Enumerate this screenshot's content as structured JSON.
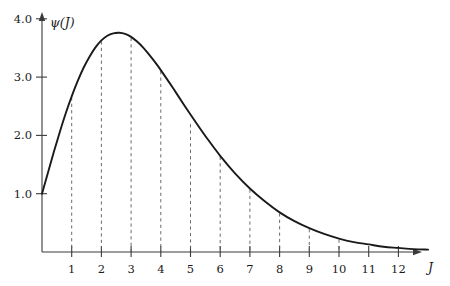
{
  "chart_data": {
    "type": "line",
    "title": "",
    "xlabel": "J",
    "ylabel": "ψ(J)",
    "xlim": [
      0,
      13.2
    ],
    "ylim": [
      0,
      4.35
    ],
    "grid": false,
    "legend": "none",
    "x_ticks": [
      1,
      2,
      3,
      4,
      5,
      6,
      7,
      8,
      9,
      10,
      11,
      12
    ],
    "x_tick_labels": [
      "1",
      "2",
      "3",
      "4",
      "5",
      "6",
      "7",
      "8",
      "9",
      "10",
      "11",
      "12"
    ],
    "y_ticks": [
      1.0,
      2.0,
      3.0,
      4.0
    ],
    "y_tick_labels": [
      "1.0",
      "2.0",
      "3.0",
      "4.0"
    ],
    "series": [
      {
        "name": "ψ(J)",
        "color": "#1a1a1a",
        "x": [
          0.0,
          0.2,
          0.4,
          0.6,
          0.8,
          1.0,
          1.2,
          1.4,
          1.6,
          1.8,
          2.0,
          2.2,
          2.4,
          2.6,
          2.8,
          3.0,
          3.2,
          3.4,
          3.6,
          3.8,
          4.0,
          4.4,
          4.8,
          5.2,
          5.6,
          6.0,
          6.5,
          7.0,
          7.5,
          8.0,
          8.5,
          9.0,
          9.5,
          10.0,
          10.5,
          11.0,
          11.5,
          12.0,
          12.5,
          13.0
        ],
        "y": [
          1.0,
          1.36,
          1.72,
          2.06,
          2.38,
          2.67,
          2.93,
          3.16,
          3.35,
          3.51,
          3.63,
          3.71,
          3.75,
          3.76,
          3.74,
          3.69,
          3.61,
          3.51,
          3.39,
          3.26,
          3.12,
          2.82,
          2.51,
          2.21,
          1.92,
          1.65,
          1.35,
          1.09,
          0.87,
          0.68,
          0.53,
          0.41,
          0.31,
          0.23,
          0.17,
          0.13,
          0.09,
          0.07,
          0.05,
          0.04
        ]
      }
    ],
    "dashed_dropline_x": [
      1,
      2,
      3,
      4,
      5,
      6,
      7,
      8,
      9,
      10
    ],
    "dashed_dropline_y": [
      2.67,
      3.63,
      3.69,
      3.12,
      2.21,
      1.65,
      1.09,
      0.68,
      0.41,
      0.23
    ],
    "annotations": []
  },
  "axis": {
    "x_arrow": true,
    "y_arrow": true,
    "x_axis_label": "J",
    "y_axis_label": "ψ(J)"
  }
}
